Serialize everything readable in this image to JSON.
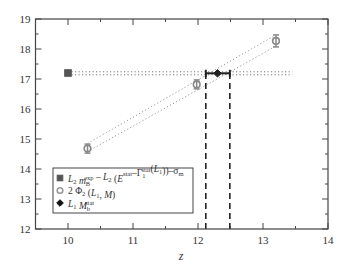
{
  "chart_data": {
    "type": "scatter",
    "title": "",
    "xlabel": "z",
    "ylabel": "",
    "xlim": [
      9.5,
      14
    ],
    "ylim": [
      12,
      19
    ],
    "xticks": [
      10,
      11,
      12,
      13,
      14
    ],
    "yticks": [
      12,
      13,
      14,
      15,
      16,
      17,
      18,
      19
    ],
    "minor_xticks": [
      9.5,
      10.5,
      11.5,
      12.5,
      13.5
    ],
    "minor_yticks": [
      12.5,
      13.5,
      14.5,
      15.5,
      16.5,
      17.5,
      18.5
    ],
    "grid": false,
    "legend_position": "lower left",
    "series": [
      {
        "name": "L2 m_B^exp - L2 (E^stat - Gamma_1^stat(L1)) - sigma_m",
        "marker": "square",
        "color": "#555555",
        "points": [
          {
            "x": 10.0,
            "y": 17.2,
            "yerr": 0.03
          }
        ]
      },
      {
        "name": "2 Phi_2 (L1, M)",
        "marker": "circle",
        "color": "#888888",
        "points": [
          {
            "x": 10.3,
            "y": 14.68,
            "yerr": 0.15
          },
          {
            "x": 11.98,
            "y": 16.82,
            "yerr": 0.15
          },
          {
            "x": 13.2,
            "y": 18.27,
            "yerr": 0.2
          }
        ]
      },
      {
        "name": "L1 M_b^stat",
        "marker": "diamond",
        "color": "#222222",
        "points": [
          {
            "x": 12.3,
            "y": 17.19,
            "xerr_low": 12.12,
            "xerr_high": 12.49
          }
        ]
      }
    ],
    "reference_lines": {
      "horizontal_dotted": [
        {
          "x0": 10.0,
          "x1": 13.45,
          "y": 17.24
        },
        {
          "x0": 10.0,
          "x1": 13.45,
          "y": 17.14
        }
      ],
      "diagonal_dotted": [
        {
          "x0": 10.3,
          "y0": 14.85,
          "x1": 13.18,
          "y1": 18.45
        },
        {
          "x0": 10.3,
          "y0": 14.58,
          "x1": 13.2,
          "y1": 18.1
        }
      ],
      "vertical_dashed": [
        {
          "x": 12.12,
          "y0": 12,
          "y1": 17.19
        },
        {
          "x": 12.49,
          "y0": 12,
          "y1": 17.19
        }
      ]
    },
    "legend": [
      {
        "marker": "square",
        "parts": [
          {
            "t": "L",
            "i": true
          },
          {
            "t": "2",
            "sub": true
          },
          {
            "t": " m",
            "i": true
          },
          {
            "t": "B",
            "sub": true
          },
          {
            "t": "exp",
            "sup": true,
            "dx": -6
          },
          {
            "t": " – "
          },
          {
            "t": "L",
            "i": true
          },
          {
            "t": "2",
            "sub": true
          },
          {
            "t": " ("
          },
          {
            "t": "E",
            "i": true
          },
          {
            "t": "stat",
            "sup": true
          },
          {
            "t": "–Γ"
          },
          {
            "t": "1",
            "sub": true
          },
          {
            "t": "stat",
            "sup": true,
            "dx": -4
          },
          {
            "t": "("
          },
          {
            "t": "L",
            "i": true
          },
          {
            "t": "1",
            "sub": true
          },
          {
            "t": "))–σ"
          },
          {
            "t": "m",
            "sub": true
          }
        ]
      },
      {
        "marker": "circle",
        "parts": [
          {
            "t": "2 Φ"
          },
          {
            "t": "2",
            "sub": true
          },
          {
            "t": " ("
          },
          {
            "t": "L",
            "i": true
          },
          {
            "t": "1",
            "sub": true
          },
          {
            "t": ", "
          },
          {
            "t": "M",
            "i": true
          },
          {
            "t": ")"
          }
        ]
      },
      {
        "marker": "diamond",
        "parts": [
          {
            "t": "L",
            "i": true
          },
          {
            "t": "1",
            "sub": true
          },
          {
            "t": " M",
            "i": true
          },
          {
            "t": "b",
            "sub": true
          },
          {
            "t": "stat",
            "sup": true,
            "dx": -5
          }
        ]
      }
    ]
  },
  "layout": {
    "plot_left_px": 35.5,
    "plot_right_px": 328,
    "plot_top_px": 19,
    "plot_bottom_px": 229,
    "legend_box": {
      "x": 53,
      "y": 168,
      "w": 140,
      "h": 45
    }
  }
}
